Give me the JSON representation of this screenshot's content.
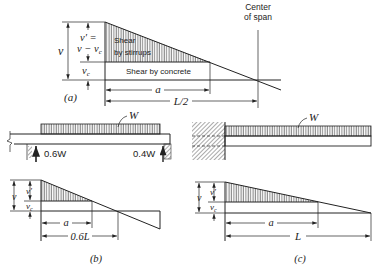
{
  "figure": {
    "a": {
      "caption": "(a)",
      "v_label": "v",
      "vprime_line1": "v′ =",
      "vprime_line2": "v − v",
      "vprime_sub": "c",
      "vc_label": "v",
      "vc_sub": "c",
      "stirrups_line1": "Shear",
      "stirrups_line2": "by stirrups",
      "concrete_label": "Shear by concrete",
      "center_line1": "Center",
      "center_line2": "of span",
      "dim_a": "a",
      "dim_half_span": "L/2"
    },
    "b": {
      "caption": "(b)",
      "load_label": "W",
      "left_reaction": "0.6W",
      "right_reaction": "0.4W",
      "v_label": "v",
      "vprime_label": "v′",
      "vc_label": "v",
      "vc_sub": "c",
      "dim_a": "a",
      "dim_span": "0.6L"
    },
    "c": {
      "caption": "(c)",
      "load_label": "W",
      "v_label": "v",
      "vprime_label": "v′",
      "vc_label": "v",
      "vc_sub": "c",
      "dim_a": "a",
      "dim_span": "L"
    }
  }
}
